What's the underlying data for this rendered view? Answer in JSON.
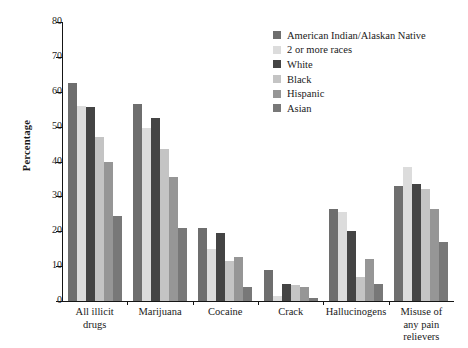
{
  "chart_data": {
    "type": "bar",
    "title": "",
    "xlabel": "",
    "ylabel": "Percentage",
    "ylim": [
      0,
      80
    ],
    "yticks": [
      0,
      10,
      20,
      30,
      40,
      50,
      60,
      70,
      80
    ],
    "grid": false,
    "legend_position": "top-right",
    "categories": [
      "All illicit drugs",
      "Marijuana",
      "Cocaine",
      "Crack",
      "Hallucinogens",
      "Misuse of any pain relievers"
    ],
    "category_lines": [
      [
        "All illicit",
        "drugs"
      ],
      [
        "Marijuana"
      ],
      [
        "Cocaine"
      ],
      [
        "Crack"
      ],
      [
        "Hallucinogens"
      ],
      [
        "Misuse of",
        "any pain",
        "relievers"
      ]
    ],
    "series": [
      {
        "name": "American Indian/Alaskan Native",
        "color": "#6e6e6e",
        "values": [
          62.5,
          56.5,
          21.0,
          9.0,
          26.5,
          33.0
        ]
      },
      {
        "name": "2 or more races",
        "color": "#dcdcdc",
        "values": [
          56.0,
          49.5,
          15.0,
          1.5,
          25.5,
          38.5
        ]
      },
      {
        "name": "White",
        "color": "#444444",
        "values": [
          55.5,
          52.5,
          19.5,
          5.0,
          20.0,
          33.5
        ]
      },
      {
        "name": "Black",
        "color": "#c4c4c4",
        "values": [
          47.0,
          43.5,
          11.5,
          4.5,
          7.0,
          32.0
        ]
      },
      {
        "name": "Hispanic",
        "color": "#969696",
        "values": [
          40.0,
          35.5,
          12.5,
          4.0,
          12.0,
          26.5
        ]
      },
      {
        "name": "Asian",
        "color": "#787878",
        "values": [
          24.5,
          21.0,
          4.0,
          1.0,
          5.0,
          17.0
        ]
      }
    ]
  }
}
